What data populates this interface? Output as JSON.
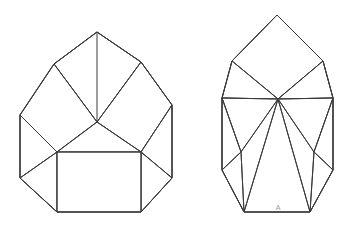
{
  "page": {
    "background_color": "#ffffff",
    "width": 359,
    "height": 226
  },
  "style": {
    "stroke_color": "#3a3a3a",
    "fill_color": "#ffffff",
    "stroke_width": 1,
    "label_color": "#9a9a9a",
    "label_font_size": 7
  },
  "figures": [
    {
      "id": "figure-left",
      "name": "left-net-diagram",
      "description": "Octagonal outline net with central hub, square face at bottom center and triangular/quadrilateral faces",
      "outline": "97,32 141,62 172,105 172,178 141,212 57,212 20,178 20,115 54,64",
      "faces": [
        {
          "name": "face-top-left-quad",
          "points": "97,32 54,64 97,122 141,62"
        },
        {
          "name": "face-left-upper-quad",
          "points": "54,64 20,115 57,152 97,122"
        },
        {
          "name": "face-right-upper-quad",
          "points": "141,62 97,122 141,152 172,105"
        },
        {
          "name": "face-center-triangle",
          "points": "97,122 57,152 141,152"
        },
        {
          "name": "face-left-triangle",
          "points": "20,115 20,178 57,152"
        },
        {
          "name": "face-right-triangle",
          "points": "172,105 141,152 172,178"
        },
        {
          "name": "face-bottom-left-triangle",
          "points": "20,178 57,212 57,152"
        },
        {
          "name": "face-bottom-right-triangle",
          "points": "172,178 141,212 141,152"
        },
        {
          "name": "face-bottom-square",
          "points": "57,152 141,152 141,212 57,212"
        }
      ],
      "edges": [
        "97,32 141,62",
        "141,62 172,105",
        "172,105 172,178",
        "172,178 141,212",
        "141,212 57,212",
        "57,212 20,178",
        "20,178 20,115",
        "20,115 54,64",
        "54,64 97,32",
        "97,32 97,122",
        "54,64 97,122",
        "141,62 97,122",
        "97,122 57,152",
        "97,122 141,152",
        "20,115 57,152",
        "172,105 141,152",
        "20,178 57,152",
        "172,178 141,152",
        "57,152 141,152",
        "57,152 57,212",
        "141,152 141,212"
      ],
      "labels": []
    },
    {
      "id": "figure-right",
      "name": "right-net-diagram",
      "description": "Pointed kite-shaped net with diamond top, central hub and fanned triangular faces, vertex labelled A",
      "outline": "277,15 323,61 333,98 333,170 310,212 244,212 222,170 222,98 232,61",
      "faces": [
        {
          "name": "face-top-diamond",
          "points": "277,15 323,61 278,99 232,61"
        },
        {
          "name": "face-upper-left-triangle",
          "points": "232,61 222,98 278,99"
        },
        {
          "name": "face-upper-right-triangle",
          "points": "323,61 333,98 278,99"
        },
        {
          "name": "face-mid-left-triangle",
          "points": "222,98 241,152 278,99"
        },
        {
          "name": "face-mid-right-triangle",
          "points": "333,98 314,152 278,99"
        },
        {
          "name": "face-lower-left-triangle",
          "points": "222,98 222,170 241,152"
        },
        {
          "name": "face-lower-right-triangle",
          "points": "333,98 333,170 314,152"
        },
        {
          "name": "face-center-long-triangle",
          "points": "278,99 244,212 310,212"
        },
        {
          "name": "face-bottom-left-triangle",
          "points": "222,170 244,212 241,152"
        },
        {
          "name": "face-bottom-right-triangle",
          "points": "333,170 310,212 314,152"
        }
      ],
      "edges": [
        "277,15 323,61",
        "323,61 333,98",
        "333,98 333,170",
        "333,170 310,212",
        "310,212 244,212",
        "244,212 222,170",
        "222,170 222,98",
        "222,98 232,61",
        "232,61 277,15",
        "232,61 278,99",
        "323,61 278,99",
        "222,98 278,99",
        "333,98 278,99",
        "222,98 241,152",
        "333,98 314,152",
        "278,99 241,152",
        "278,99 314,152",
        "222,170 241,152",
        "333,170 314,152",
        "241,152 244,212",
        "314,152 310,212",
        "278,99 244,212",
        "278,99 310,212"
      ],
      "labels": [
        {
          "name": "vertex-label-a",
          "text": "A",
          "x": 278,
          "y": 208
        }
      ]
    }
  ]
}
